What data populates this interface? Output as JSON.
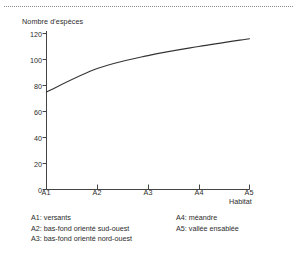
{
  "figure": {
    "separator": "dotted-rule"
  },
  "chart_data": {
    "type": "line",
    "title": "",
    "xlabel": "Habitat",
    "ylabel": "Nombre d'espèces",
    "categories": [
      "A1",
      "A2",
      "A3",
      "A4",
      "A5"
    ],
    "values": [
      75,
      93,
      103,
      110,
      116
    ],
    "series": [
      {
        "name": "Nombre d'espèces",
        "values": [
          75,
          93,
          103,
          110,
          116
        ]
      }
    ],
    "ylim": [
      0,
      120
    ],
    "yticks": [
      0,
      20,
      40,
      60,
      80,
      100,
      120
    ],
    "xticks": [
      "A1",
      "A2",
      "A3",
      "A4",
      "A5"
    ],
    "grid": false,
    "legend_position": "below-plot",
    "line_color": "#333333"
  },
  "axes": {
    "y_label": "Nombre d'espèces",
    "x_label": "Habitat",
    "y_ticks": [
      "120",
      "100",
      "80",
      "60",
      "40",
      "20",
      "0"
    ],
    "x_ticks": [
      "A1",
      "A2",
      "A3",
      "A4",
      "A5"
    ]
  },
  "legend": {
    "left_column": [
      "A1: versants",
      "A2: bas-fond orienté sud-ouest",
      "A3: bas-fond orienté nord-ouest"
    ],
    "right_column": [
      "A4: méandre",
      "A5: vallée ensablée"
    ]
  }
}
